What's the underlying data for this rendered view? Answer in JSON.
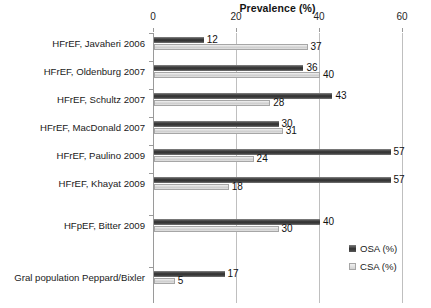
{
  "chart_data": {
    "type": "bar",
    "orientation": "horizontal",
    "title": "Prevalence (%)",
    "xlabel": "Prevalence (%)",
    "ylabel": "",
    "xlim": [
      0,
      60
    ],
    "xticks": [
      0,
      20,
      40,
      60
    ],
    "grid": true,
    "legend_position": "bottom-right",
    "categories": [
      "HFrEF, Javaheri 2006",
      "HFrEF, Oldenburg 2007",
      "HFrEF, Schultz 2007",
      "HFrEF, MacDonald 2007",
      "HFrEF, Paulino 2009",
      "HFrEF, Khayat 2009",
      "HFpEF,  Bitter 2009",
      "Gral population Peppard/Bixler"
    ],
    "series": [
      {
        "name": "OSA (%)",
        "color": "#2e2e2e",
        "values": [
          12,
          36,
          43,
          30,
          57,
          57,
          40,
          17
        ]
      },
      {
        "name": "CSA (%)",
        "color": "#d2d2d2",
        "values": [
          37,
          40,
          28,
          31,
          24,
          18,
          30,
          5
        ]
      }
    ]
  }
}
